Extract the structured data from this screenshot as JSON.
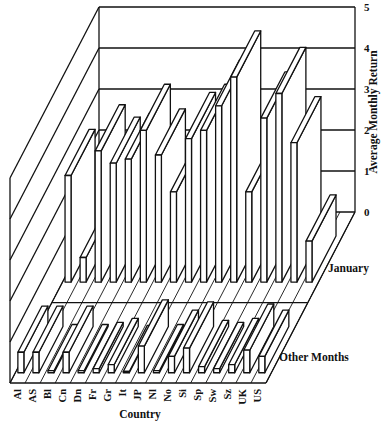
{
  "chart_data": {
    "type": "bar",
    "subtype": "3d-bar",
    "title": "",
    "xlabel": "Country",
    "ylabel": "Average Monthly Return",
    "zlabel_rows": [
      "January",
      "Other Months"
    ],
    "categories": [
      "Al",
      "AS",
      "Bl",
      "Cn",
      "Dn",
      "Fr",
      "Gr",
      "It",
      "JP",
      "Nl",
      "No",
      "Si",
      "Sp",
      "Sw",
      "Sz",
      "UK",
      "US"
    ],
    "series": [
      {
        "name": "January",
        "values": [
          2.6,
          0.6,
          3.2,
          2.9,
          3.0,
          3.7,
          3.1,
          2.2,
          3.5,
          3.7,
          4.3,
          5.0,
          2.2,
          4.0,
          4.6,
          3.4,
          1.0
        ]
      },
      {
        "name": "Other Months",
        "values": [
          0.5,
          0.5,
          0.05,
          0.5,
          0.05,
          0.1,
          0.2,
          0.02,
          0.65,
          0.05,
          0.4,
          0.6,
          0.15,
          0.1,
          0.2,
          0.55,
          0.4
        ]
      }
    ],
    "yticks": [
      0,
      1,
      2,
      3,
      4,
      5
    ],
    "ylim": [
      0,
      5
    ],
    "grid": true,
    "legend": "row labels at right"
  },
  "labels": {
    "xlabel": "Country",
    "ylabel": "Average Monthly Return",
    "row_january": "January",
    "row_other": "Other Months"
  },
  "style": {
    "line_color": "#111111",
    "bar_fill": "#ffffff",
    "background": "#ffffff"
  }
}
